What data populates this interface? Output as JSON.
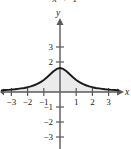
{
  "figure": {
    "cut_off_formula": "x  + 1",
    "background_color": "#ffffff",
    "axis_color": "#5a5a5a",
    "curve_color": "#1a1a1a",
    "fill_color": "#ebebeb"
  },
  "axis_labels": {
    "x": "x",
    "y": "y"
  },
  "x_ticks": [
    {
      "value": -3,
      "label": "−3"
    },
    {
      "value": -2,
      "label": "−2"
    },
    {
      "value": -1,
      "label": "−1"
    },
    {
      "value": 1,
      "label": "1"
    },
    {
      "value": 2,
      "label": "2"
    },
    {
      "value": 3,
      "label": "3"
    }
  ],
  "y_ticks": [
    {
      "value": 3,
      "label": "3"
    },
    {
      "value": 2,
      "label": "2"
    },
    {
      "value": -1,
      "label": "−1"
    },
    {
      "value": -2,
      "label": "−2"
    },
    {
      "value": -3,
      "label": "−3"
    }
  ],
  "chart_data": {
    "type": "line",
    "title": "",
    "xlabel": "x",
    "ylabel": "y",
    "xlim": [
      -3.6,
      3.6
    ],
    "ylim": [
      -3.4,
      3.6
    ],
    "grid": false,
    "legend": false,
    "shaded_region": {
      "between": "curve and x-axis",
      "color": "#ebebeb"
    },
    "series": [
      {
        "name": "f(x) = 1.6/(x^2 + 1)",
        "x": [
          -3.6,
          -3.4,
          -3.2,
          -3.0,
          -2.8,
          -2.6,
          -2.4,
          -2.2,
          -2.0,
          -1.8,
          -1.6,
          -1.4,
          -1.2,
          -1.0,
          -0.8,
          -0.6,
          -0.4,
          -0.2,
          0.0,
          0.2,
          0.4,
          0.6,
          0.8,
          1.0,
          1.2,
          1.4,
          1.6,
          1.8,
          2.0,
          2.2,
          2.4,
          2.6,
          2.8,
          3.0,
          3.2,
          3.4,
          3.6
        ],
        "y": [
          0.11,
          0.13,
          0.14,
          0.16,
          0.18,
          0.21,
          0.24,
          0.27,
          0.32,
          0.38,
          0.45,
          0.54,
          0.66,
          0.8,
          0.98,
          1.18,
          1.38,
          1.54,
          1.6,
          1.54,
          1.38,
          1.18,
          0.98,
          0.8,
          0.66,
          0.54,
          0.45,
          0.38,
          0.32,
          0.27,
          0.24,
          0.21,
          0.18,
          0.16,
          0.14,
          0.13,
          0.11
        ],
        "peak": {
          "x": 0,
          "y": 1.6
        }
      }
    ]
  }
}
